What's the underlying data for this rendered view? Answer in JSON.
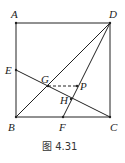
{
  "figure": {
    "caption": "图 4.31",
    "points": {
      "A": {
        "label": "A",
        "x": 16,
        "y": 23
      },
      "D": {
        "label": "D",
        "x": 110,
        "y": 23
      },
      "B": {
        "label": "B",
        "x": 16,
        "y": 117
      },
      "C": {
        "label": "C",
        "x": 110,
        "y": 117
      },
      "E": {
        "label": "E",
        "x": 16,
        "y": 70
      },
      "F": {
        "label": "F",
        "x": 63,
        "y": 117
      },
      "G": {
        "label": "G",
        "x": 48,
        "y": 86
      },
      "H": {
        "label": "H",
        "x": 71,
        "y": 99
      },
      "P": {
        "label": "P",
        "x": 77,
        "y": 86
      }
    },
    "segments": [
      "AD",
      "DC",
      "CB",
      "BA",
      "BD",
      "DF",
      "EC"
    ],
    "dashed_segments": [
      "GP"
    ],
    "stroke_color": "#222222"
  }
}
